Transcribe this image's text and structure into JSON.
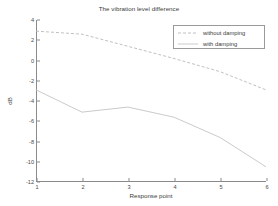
{
  "figure": {
    "background_color": "#ffffff"
  },
  "chart_data": {
    "type": "line",
    "title": "The vibration level difference",
    "xlabel": "Response point",
    "ylabel": "dB",
    "x": [
      1,
      2,
      3,
      4,
      5,
      6
    ],
    "xlim": [
      1,
      6
    ],
    "ylim": [
      -12,
      4
    ],
    "xticks": [
      1,
      2,
      3,
      4,
      5,
      6
    ],
    "xtick_labels": [
      "1",
      "2",
      "3",
      "4",
      "5",
      "6"
    ],
    "yticks": [
      4,
      2,
      0,
      -2,
      -4,
      -6,
      -8,
      -10,
      -12
    ],
    "ytick_labels": [
      "4",
      "2",
      "0",
      "-2",
      "-4",
      "-6",
      "-8",
      "-10",
      "-12"
    ],
    "grid": false,
    "legend_position": "upper right",
    "series": [
      {
        "name": "without damping",
        "values": [
          2.9,
          2.6,
          1.4,
          0.2,
          -1.1,
          -2.9
        ],
        "style": "dashed",
        "color": "#b9b9b9",
        "marker": "none"
      },
      {
        "name": "with damping",
        "values": [
          -2.9,
          -5.1,
          -4.6,
          -5.6,
          -7.6,
          -10.5
        ],
        "style": "solid",
        "color": "#c4c4c4",
        "marker": "none"
      }
    ]
  },
  "legend": {
    "entries": [
      {
        "label": "without damping"
      },
      {
        "label": "with damping"
      }
    ]
  },
  "axis_color": "#8a8a8a",
  "text_color": "#3a3a3a"
}
